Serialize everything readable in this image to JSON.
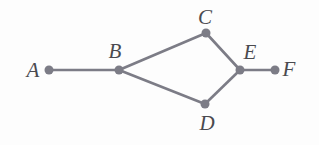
{
  "figure": {
    "kind": "undirected-graph-diagram",
    "background_color": "#fdfdfd",
    "vertex_color": "#7c7c86",
    "edge_color": "#7c7c86",
    "label_color": "#4a4a4f",
    "vertex_radius": 4.5,
    "edge_width": 2.6,
    "width": 319,
    "height": 145
  },
  "chart_data": {
    "type": "diagram",
    "title": "",
    "nodes": [
      {
        "id": "A",
        "label": "A",
        "x": 49,
        "y": 70,
        "label_x": 33,
        "label_y": 70
      },
      {
        "id": "B",
        "label": "B",
        "x": 119,
        "y": 70,
        "label_x": 115,
        "label_y": 51
      },
      {
        "id": "C",
        "label": "C",
        "x": 206,
        "y": 33,
        "label_x": 205,
        "label_y": 17
      },
      {
        "id": "D",
        "label": "D",
        "x": 205,
        "y": 104,
        "label_x": 207,
        "label_y": 123
      },
      {
        "id": "E",
        "label": "E",
        "x": 240,
        "y": 70,
        "label_x": 250,
        "label_y": 52
      },
      {
        "id": "F",
        "label": "F",
        "x": 275,
        "y": 70,
        "label_x": 289,
        "label_y": 69
      }
    ],
    "edges": [
      {
        "from": "A",
        "to": "B"
      },
      {
        "from": "B",
        "to": "C"
      },
      {
        "from": "B",
        "to": "D"
      },
      {
        "from": "C",
        "to": "E"
      },
      {
        "from": "D",
        "to": "E"
      },
      {
        "from": "E",
        "to": "F"
      }
    ],
    "node_labels": [
      "A",
      "B",
      "C",
      "D",
      "E",
      "F"
    ],
    "edge_list": [
      "A-B",
      "B-C",
      "B-D",
      "C-E",
      "D-E",
      "E-F"
    ]
  }
}
